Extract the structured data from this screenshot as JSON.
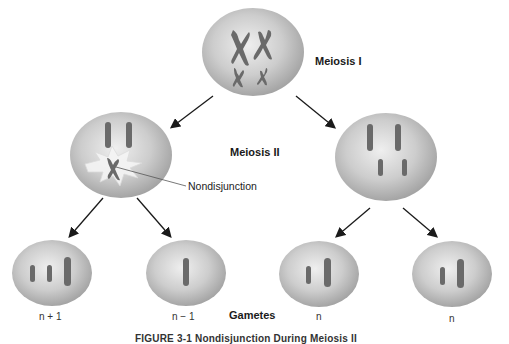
{
  "diagram": {
    "type": "meiosis nondisjunction flow",
    "stages": {
      "meiosis_1": "Meiosis I",
      "meiosis_2": "Meiosis II",
      "gametes": "Gametes"
    },
    "callout": "Nondisjunction",
    "gamete_labels": [
      "n + 1",
      "n − 1",
      "n",
      "n"
    ],
    "caption": "FIGURE 3-1 Nondisjunction During Meiosis II",
    "colors": {
      "cell_fill": "#c8c8c8",
      "cell_highlight": "#ececec",
      "cell_shadow": "#9a9a9a",
      "chromosome": "#6a6a6a",
      "arrow": "#1a1a1a",
      "burst": "#f4f4f4"
    },
    "cells": [
      {
        "id": "parent",
        "chromosomes": "2 large X + 2 small X"
      },
      {
        "id": "meiosis2-left",
        "chromosomes": "2 large + 1 small X (nondisjunction)"
      },
      {
        "id": "meiosis2-right",
        "chromosomes": "2 large + 2 small"
      },
      {
        "id": "gamete-1",
        "chromosomes": "2 small + 1 large"
      },
      {
        "id": "gamete-2",
        "chromosomes": "1 large"
      },
      {
        "id": "gamete-3",
        "chromosomes": "1 small + 1 large"
      },
      {
        "id": "gamete-4",
        "chromosomes": "1 small + 1 large"
      }
    ]
  }
}
